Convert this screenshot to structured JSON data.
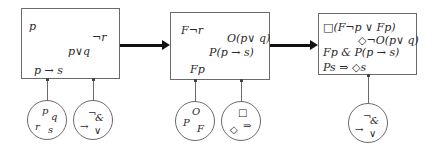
{
  "boxes": [
    {
      "id": "box1",
      "formulas": [
        "p",
        "¬r",
        "p∨q",
        "p → s"
      ]
    },
    {
      "id": "box2",
      "formulas": [
        "F¬r",
        "O(p∨ q)",
        "P(p → s)",
        "Fp"
      ]
    },
    {
      "id": "box3",
      "formulas": [
        "□(F¬p ∨ Fp)",
        "◇¬O(p∨ q)",
        "Fp & P(p → s)",
        "Ps ⇒ ◇s"
      ]
    }
  ],
  "circles": [
    {
      "id": "atoms",
      "symbols": [
        "p",
        "q",
        "r",
        "s"
      ]
    },
    {
      "id": "connectives-1",
      "symbols": [
        "¬",
        "&",
        "→",
        "∨"
      ]
    },
    {
      "id": "deontic-temporal-operators",
      "symbols": [
        "O",
        "P",
        "F"
      ]
    },
    {
      "id": "modal-operators",
      "symbols": [
        "□",
        "◇",
        "⇒"
      ]
    },
    {
      "id": "connectives-2",
      "symbols": [
        "¬",
        "&",
        "→",
        "∨"
      ]
    }
  ],
  "colors": {
    "border": "#6a6a6a",
    "arrow": "#111111",
    "text": "#2a2a2a",
    "background": "#ffffff"
  }
}
